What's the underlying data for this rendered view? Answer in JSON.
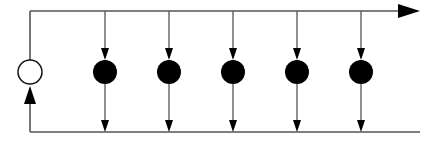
{
  "diagram": {
    "width": 436,
    "height": 141,
    "stroke_color": "#555555",
    "fill_color": "#000000",
    "source_node": {
      "cx": 30,
      "cy": 72,
      "r": 12,
      "fill": "#ffffff"
    },
    "top_line": {
      "x1": 30,
      "y1": 11,
      "x2": 400,
      "y2": 11
    },
    "top_arrowhead": "398,4 420,11 398,18",
    "left_top_segment": {
      "x1": 30,
      "y1": 11,
      "x2": 30,
      "y2": 60
    },
    "left_bottom_segment": {
      "x1": 30,
      "y1": 104,
      "x2": 30,
      "y2": 132
    },
    "left_arrowhead": "30,86 24,104 36,104",
    "bottom_line": {
      "x1": 30,
      "y1": 132,
      "x2": 420,
      "y2": 132
    },
    "nodes": [
      {
        "cx": 105,
        "cy": 72,
        "r": 12
      },
      {
        "cx": 169,
        "cy": 72,
        "r": 12
      },
      {
        "cx": 233,
        "cy": 72,
        "r": 12
      },
      {
        "cx": 297,
        "cy": 72,
        "r": 12
      },
      {
        "cx": 361,
        "cy": 72,
        "r": 12
      }
    ]
  }
}
